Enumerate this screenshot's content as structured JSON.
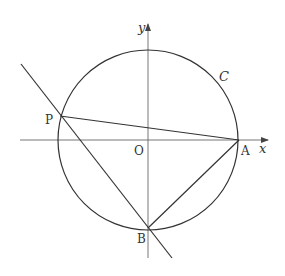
{
  "diagram": {
    "type": "coordinate-geometry",
    "axes": {
      "x_label": "x",
      "y_label": "y",
      "origin_label": "O"
    },
    "circle": {
      "label": "C",
      "center_px": [
        148,
        140
      ],
      "radius_px": 90
    },
    "points": [
      {
        "name": "P",
        "label": "P",
        "px": [
          60,
          116
        ]
      },
      {
        "name": "A",
        "label": "A",
        "px": [
          239,
          140
        ]
      },
      {
        "name": "B",
        "label": "B",
        "px": [
          148,
          228
        ]
      },
      {
        "name": "O",
        "label": "O",
        "px": [
          148,
          140
        ]
      }
    ],
    "segments": [
      {
        "from": "P",
        "to": "A"
      },
      {
        "from": "A",
        "to": "B"
      }
    ],
    "lines": [
      {
        "name": "line-PB",
        "through": [
          "P",
          "B"
        ],
        "extended": true
      }
    ],
    "colors": {
      "stroke": "#333333",
      "axis": "#555555",
      "background": "#ffffff"
    }
  }
}
